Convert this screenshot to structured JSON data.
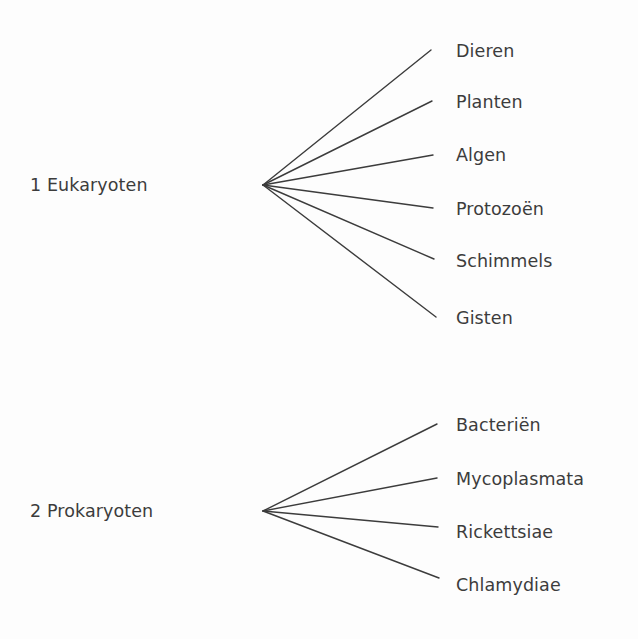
{
  "document": {
    "title": "Classificatie: Eukaryoten en Prokaryoten",
    "background_color": "#fdfdfd",
    "ink_color": "#3c3c3c"
  },
  "diagram": {
    "type": "fan-tree",
    "groups": [
      {
        "id": "eukaryoten",
        "number": "1",
        "label": "1 Eukaryoten",
        "name": "Eukaryoten",
        "vertex": {
          "x": 263,
          "y": 185
        },
        "leaves": [
          {
            "label": "Dieren",
            "line_end": {
              "x": 431,
              "y": 50
            },
            "text_y": 52
          },
          {
            "label": "Planten",
            "line_end": {
              "x": 432,
              "y": 101
            },
            "text_y": 103
          },
          {
            "label": "Algen",
            "line_end": {
              "x": 433,
              "y": 155
            },
            "text_y": 156
          },
          {
            "label": "Protozoën",
            "line_end": {
              "x": 433,
              "y": 208
            },
            "text_y": 210
          },
          {
            "label": "Schimmels",
            "line_end": {
              "x": 434,
              "y": 259
            },
            "text_y": 262
          },
          {
            "label": "Gisten",
            "line_end": {
              "x": 436,
              "y": 317
            },
            "text_y": 319
          }
        ]
      },
      {
        "id": "prokaryoten",
        "number": "2",
        "label": "2 Prokaryoten",
        "name": "Prokaryoten",
        "vertex": {
          "x": 263,
          "y": 511
        },
        "leaves": [
          {
            "label": "Bacteriën",
            "line_end": {
              "x": 437,
              "y": 424
            },
            "text_y": 426
          },
          {
            "label": "Mycoplasmata",
            "line_end": {
              "x": 437,
              "y": 478
            },
            "text_y": 480
          },
          {
            "label": "Rickettsiae",
            "line_end": {
              "x": 438,
              "y": 527
            },
            "text_y": 533
          },
          {
            "label": "Chlamydiae",
            "line_end": {
              "x": 439,
              "y": 578
            },
            "text_y": 586
          }
        ]
      }
    ]
  }
}
